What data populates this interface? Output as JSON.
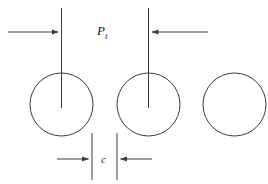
{
  "diagram": {
    "background_color": "#ffffff",
    "line_color": "#3c3c3c",
    "text_color": "#1a1a1a",
    "labels": {
      "pitch_symbol": "P",
      "pitch_subscript": "t",
      "clearance_symbol": "c"
    },
    "circles": [
      {
        "name": "tube-1",
        "cx": 61.5,
        "cy": 104.5,
        "r": 31.5
      },
      {
        "name": "tube-2",
        "cx": 148.5,
        "cy": 104.5,
        "r": 31.5
      },
      {
        "name": "tube-3",
        "cx": 234.5,
        "cy": 104.5,
        "r": 31.5
      }
    ],
    "centerlines": [
      {
        "name": "centerline-1",
        "x": 61.5,
        "y1": 8,
        "y2": 108
      },
      {
        "name": "centerline-2",
        "x": 148.5,
        "y1": 8,
        "y2": 108
      }
    ],
    "extension_lines": [
      {
        "name": "extension-left",
        "x": 92,
        "y1": 133,
        "y2": 180
      },
      {
        "name": "extension-right",
        "x": 117,
        "y1": 133,
        "y2": 180
      }
    ],
    "dimension_arrows": [
      {
        "name": "pitch-arrow-left",
        "x1": 8,
        "y1": 32,
        "x2": 61.5,
        "y2": 32,
        "direction": "right"
      },
      {
        "name": "pitch-arrow-right",
        "x1": 208,
        "y1": 32,
        "x2": 148.5,
        "y2": 32,
        "direction": "left"
      },
      {
        "name": "clearance-arrow-left",
        "x1": 57,
        "y1": 159,
        "x2": 92,
        "y2": 159,
        "direction": "right"
      },
      {
        "name": "clearance-arrow-right",
        "x1": 152,
        "y1": 159,
        "x2": 117,
        "y2": 159,
        "direction": "left"
      }
    ],
    "label_positions": {
      "pitch": {
        "x": 97,
        "y": 35
      },
      "clearance": {
        "x": 101,
        "y": 163
      }
    }
  }
}
